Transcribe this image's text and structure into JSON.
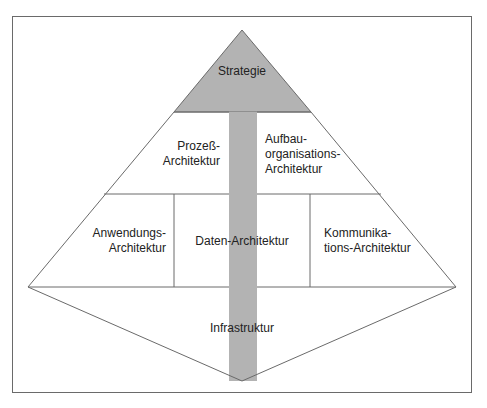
{
  "diagram": {
    "type": "architecture-pyramid",
    "colors": {
      "line": "#6a6a6a",
      "shaft": "#b3b3b3",
      "apex": "#b3b3b3",
      "text": "#222222",
      "background": "#ffffff"
    },
    "labels": {
      "strategie": "Strategie",
      "prozess_1": "Prozeß-",
      "prozess_2": "Architektur",
      "aufbau_1": "Aufbau-",
      "aufbau_2": "organisations-",
      "aufbau_3": "Architektur",
      "anwendung_1": "Anwendungs-",
      "anwendung_2": "Architektur",
      "daten": "Daten-Architektur",
      "kommunikation_1": "Kommunika-",
      "kommunikation_2": "tions-Architektur",
      "infrastruktur": "Infrastruktur"
    }
  }
}
